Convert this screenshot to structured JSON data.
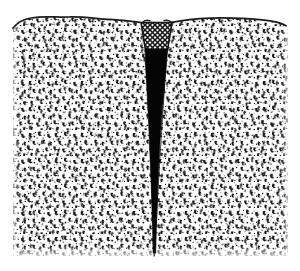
{
  "figure": {
    "title": "Cross-section of stippled rock mass with central dark fissure intrusion",
    "caption": "",
    "width": 300,
    "height": 271,
    "background_color": "#ffffff"
  },
  "colors": {
    "paper": "#ffffff",
    "ink": "#111111",
    "stipple": "#1a1a1a",
    "fill_black": "#050505",
    "outline": "#1c1c1c",
    "mesh_line": "#151515",
    "mesh_bg": "#f2f2f2"
  },
  "regions": [
    {
      "id": "host-rock-left",
      "name": "left stippled rock mass",
      "pattern": "stipple",
      "fill": "#ffffff",
      "description": "Dense irregular stipple of small dark marks representing granular sediment / breccia."
    },
    {
      "id": "host-rock-right",
      "name": "right stippled rock mass",
      "pattern": "stipple",
      "fill": "#ffffff",
      "description": "Dense irregular stipple mirroring the left mass across the fissure."
    },
    {
      "id": "mesh-cap",
      "name": "cross-hatched cap at fissure mouth",
      "pattern": "cross-hatch",
      "fill": "#f2f2f2",
      "shape": "trapezoid widening upward",
      "description": "Diagonal cross-hatched trapezoid filling the flared top of the notch."
    },
    {
      "id": "dark-wedge",
      "name": "black tapering wedge intrusion",
      "pattern": "solid",
      "fill": "#050505",
      "shape": "narrow downward-tapering wedge ending in a hairline",
      "description": "Solid black vertical wedge narrowing from the mesh cap down to a thin line at the base."
    }
  ],
  "geometry": {
    "block": {
      "left": 13,
      "right": 288,
      "top": 16,
      "bottom": 256
    },
    "top_edge": "wavy irregular dark outline dipping toward the central notch",
    "notch": {
      "center_x": 154,
      "mouth_left": 142,
      "mouth_right": 172,
      "mouth_top": 22,
      "mesh_bottom": 50
    },
    "wedge": {
      "top_width": 22,
      "mid_width": 12,
      "tip_width": 2,
      "tip_y": 252
    }
  },
  "annotations": [],
  "labels": [],
  "legend": {
    "visible": false,
    "entries": []
  }
}
